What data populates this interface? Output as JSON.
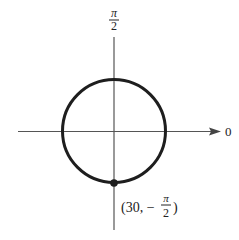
{
  "figure": {
    "type": "polar_graph",
    "axis_labels": {
      "polar_axis": "0",
      "vertical_axis_numerator": "π",
      "vertical_axis_denominator": "2"
    },
    "point": {
      "label_open": "(30, −",
      "label_frac_num": "π",
      "label_frac_den": "2",
      "label_close": ")",
      "r": 30,
      "theta": "-π/2"
    },
    "colors": {
      "curve": "#1e1e1e",
      "axis": "#555555",
      "background": "#ffffff"
    }
  }
}
